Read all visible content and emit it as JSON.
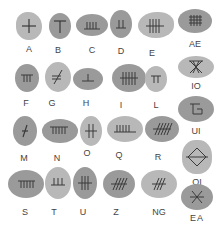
{
  "stones": [
    {
      "letter": "A"
    },
    {
      "letter": "B"
    },
    {
      "letter": "C"
    },
    {
      "letter": "D"
    },
    {
      "letter": "E"
    },
    {
      "letter": "AE"
    },
    {
      "letter": "F"
    },
    {
      "letter": "G"
    },
    {
      "letter": "H"
    },
    {
      "letter": "I"
    },
    {
      "letter": "L"
    },
    {
      "letter": "IO"
    },
    {
      "letter": "M"
    },
    {
      "letter": "N"
    },
    {
      "letter": "O"
    },
    {
      "letter": "Q"
    },
    {
      "letter": "R"
    },
    {
      "letter": "UI"
    },
    {
      "letter": "S"
    },
    {
      "letter": "T"
    },
    {
      "letter": "U"
    },
    {
      "letter": "Z"
    },
    {
      "letter": "NG"
    },
    {
      "letter": "OI"
    },
    {
      "letter": "EA"
    }
  ],
  "colors": {
    "stone_dark": "#9a9a9a",
    "stone_light": "#b8b8b8",
    "glyph": "#3a3a3a",
    "label": "#444444"
  }
}
